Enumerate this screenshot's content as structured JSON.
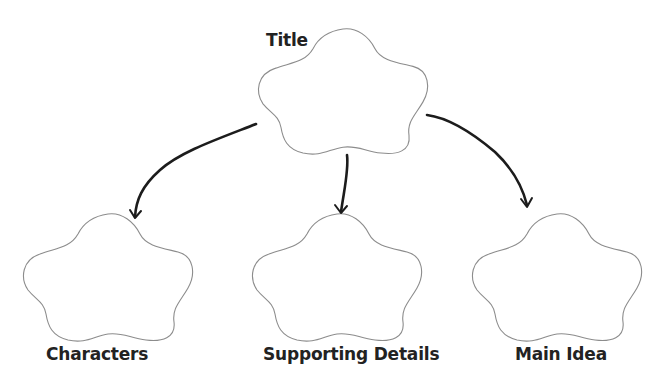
{
  "diagram": {
    "type": "graphic-organizer",
    "colors": {
      "background": "#ffffff",
      "shape_outline": "#8c8c8c",
      "arrow": "#1c1c1c",
      "label_text": "#222222"
    },
    "nodes": [
      {
        "id": "title",
        "label": "Title",
        "shape": "flower",
        "role": "root"
      },
      {
        "id": "characters",
        "label": "Characters",
        "shape": "flower",
        "role": "child"
      },
      {
        "id": "supporting_details",
        "label": "Supporting Details",
        "shape": "flower",
        "role": "child"
      },
      {
        "id": "main_idea",
        "label": "Main Idea",
        "shape": "flower",
        "role": "child"
      }
    ],
    "edges": [
      {
        "from": "title",
        "to": "characters",
        "style": "curved-arrow"
      },
      {
        "from": "title",
        "to": "supporting_details",
        "style": "straight-arrow"
      },
      {
        "from": "title",
        "to": "main_idea",
        "style": "curved-arrow"
      }
    ]
  }
}
